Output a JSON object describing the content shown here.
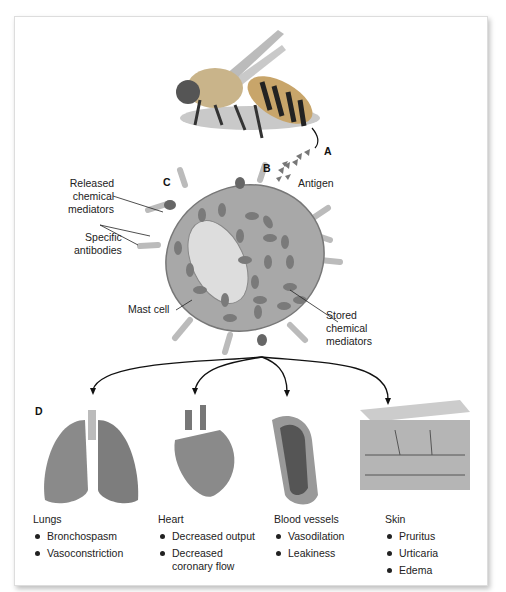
{
  "letters": {
    "a": "A",
    "b": "B",
    "c": "C",
    "d": "D"
  },
  "labels": {
    "antigen": "Antigen",
    "released": [
      "Released",
      "chemical",
      "mediators"
    ],
    "antibodies": [
      "Specific",
      "antibodies"
    ],
    "mast_cell": "Mast cell",
    "stored": [
      "Stored",
      "chemical",
      "mediators"
    ]
  },
  "organs": [
    {
      "title": "Lungs",
      "effects": [
        "Bronchospasm",
        "Vasoconstriction"
      ]
    },
    {
      "title": "Heart",
      "effects": [
        "Decreased output",
        "Decreased coronary flow"
      ]
    },
    {
      "title": "Blood vessels",
      "effects": [
        "Vasodilation",
        "Leakiness"
      ]
    },
    {
      "title": "Skin",
      "effects": [
        "Pruritus",
        "Urticaria",
        "Edema"
      ]
    }
  ],
  "colors": {
    "cell": "#a8a8a8",
    "granule": "#7a7a7a",
    "antigen": "#777",
    "line": "#111"
  }
}
